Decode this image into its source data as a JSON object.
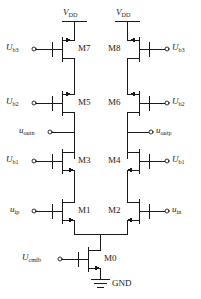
{
  "figure": {
    "kind": "schematic",
    "line_color": "#1a1a1a",
    "background": "#ffffff"
  },
  "supplies": {
    "vdd_left": {
      "sym": "V",
      "sub": "DD"
    },
    "vdd_right": {
      "sym": "V",
      "sub": "DD"
    },
    "gnd": {
      "label": "GND"
    }
  },
  "transistors": [
    {
      "id": "M7",
      "label": "M7",
      "type": "pmos",
      "side": "left",
      "row": 1
    },
    {
      "id": "M8",
      "label": "M8",
      "type": "pmos",
      "side": "right",
      "row": 1
    },
    {
      "id": "M5",
      "label": "M5",
      "type": "pmos",
      "side": "left",
      "row": 2
    },
    {
      "id": "M6",
      "label": "M6",
      "type": "pmos",
      "side": "right",
      "row": 2
    },
    {
      "id": "M3",
      "label": "M3",
      "type": "nmos",
      "side": "left",
      "row": 3
    },
    {
      "id": "M4",
      "label": "M4",
      "type": "nmos",
      "side": "right",
      "row": 3
    },
    {
      "id": "M1",
      "label": "M1",
      "type": "nmos",
      "side": "left",
      "row": 4
    },
    {
      "id": "M2",
      "label": "M2",
      "type": "nmos",
      "side": "right",
      "row": 4
    },
    {
      "id": "M0",
      "label": "M0",
      "type": "nmos",
      "side": "center",
      "row": 5
    }
  ],
  "bias_terminals": [
    {
      "id": "ub3-left",
      "sym": "U",
      "sub": "b3",
      "side": "left",
      "device": "M7"
    },
    {
      "id": "ub3-right",
      "sym": "U",
      "sub": "b3",
      "side": "right",
      "device": "M8"
    },
    {
      "id": "ub2-left",
      "sym": "U",
      "sub": "b2",
      "side": "left",
      "device": "M5"
    },
    {
      "id": "ub2-right",
      "sym": "U",
      "sub": "b2",
      "side": "right",
      "device": "M6"
    },
    {
      "id": "ub1-left",
      "sym": "U",
      "sub": "b1",
      "side": "left",
      "device": "M3"
    },
    {
      "id": "ub1-right",
      "sym": "U",
      "sub": "b1",
      "side": "right",
      "device": "M4"
    },
    {
      "id": "uip",
      "sym": "u",
      "sub": "ip",
      "side": "left",
      "device": "M1"
    },
    {
      "id": "uin",
      "sym": "u",
      "sub": "in",
      "side": "right",
      "device": "M2"
    },
    {
      "id": "ucmfb",
      "sym": "U",
      "sub": "cmfb",
      "side": "left",
      "device": "M0"
    }
  ],
  "output_terminals": [
    {
      "id": "uoutn",
      "sym": "u",
      "sub": "outn",
      "side": "left"
    },
    {
      "id": "uoutp",
      "sym": "u",
      "sub": "outp",
      "side": "right"
    }
  ]
}
